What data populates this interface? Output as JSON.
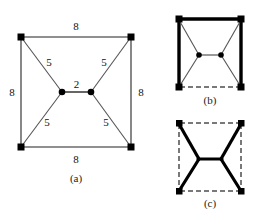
{
  "figure": {
    "panels": [
      {
        "id": "a",
        "caption": "(a)",
        "description": "Square network with four terminal corners, two Steiner points joined by a central edge; all edges labelled with lengths.",
        "edge_labels": {
          "top": "8",
          "bottom": "8",
          "left": "8",
          "right": "8",
          "upper_left_diagonal": "5",
          "upper_right_diagonal": "5",
          "lower_left_diagonal": "5",
          "lower_right_diagonal": "5",
          "center": "2"
        }
      },
      {
        "id": "b",
        "caption": "(b)",
        "description": "Spanning tree solution: three bold square sides, bottom side dashed, thin bowtie edges.",
        "edge_labels": {}
      },
      {
        "id": "c",
        "caption": "(c)",
        "description": "Steiner tree solution: bold bowtie edges, square sides all dashed.",
        "edge_labels": {}
      }
    ],
    "colors": {
      "line": "#5a5a5a",
      "bold": "#000000",
      "dashed": "#4d4d4d",
      "node": "#000000",
      "background": "#ffffff"
    },
    "geometry": {
      "panel_a": {
        "corners": [
          [
            21,
            37
          ],
          [
            131,
            37
          ],
          [
            131,
            147
          ],
          [
            21,
            147
          ]
        ],
        "steiner_points": [
          [
            62,
            92
          ],
          [
            91,
            92
          ]
        ]
      },
      "panel_b": {
        "corners": [
          [
            178,
            19
          ],
          [
            242,
            19
          ],
          [
            242,
            88
          ],
          [
            178,
            88
          ]
        ],
        "steiner_points": [
          [
            199,
            55
          ],
          [
            221,
            55
          ]
        ]
      },
      "panel_c": {
        "corners": [
          [
            178,
            123
          ],
          [
            242,
            123
          ],
          [
            242,
            192
          ],
          [
            178,
            192
          ]
        ],
        "steiner_points": [
          [
            199,
            159
          ],
          [
            221,
            159
          ]
        ]
      }
    }
  }
}
